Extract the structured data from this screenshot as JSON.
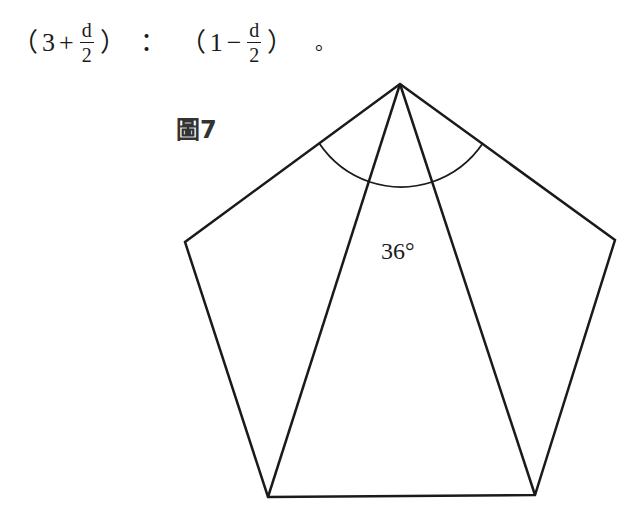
{
  "formula": {
    "open1": "（",
    "a": "3",
    "op1": "+",
    "frac1": {
      "num": "d",
      "den": "2"
    },
    "close1": "）",
    "ratio": "：",
    "open2": "（",
    "b": "1",
    "op2": "−",
    "frac2": {
      "num": "d",
      "den": "2"
    },
    "close2": "）",
    "end": "。"
  },
  "figure": {
    "label": "圖7",
    "angle_label": "36°",
    "pentagon_vertices": [
      [
        400,
        84
      ],
      [
        615,
        240
      ],
      [
        535,
        495
      ],
      [
        268,
        497
      ],
      [
        185,
        242
      ]
    ],
    "diagonals": [
      [
        [
          400,
          84
        ],
        [
          268,
          497
        ]
      ],
      [
        [
          400,
          84
        ],
        [
          535,
          495
        ]
      ]
    ],
    "stroke_color": "#1a1a1a"
  }
}
